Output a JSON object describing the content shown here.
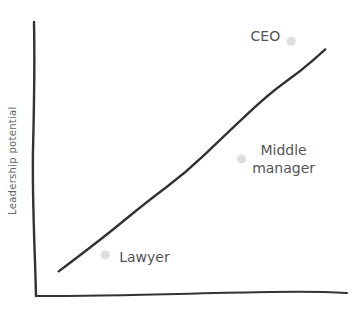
{
  "chart_data": {
    "type": "scatter",
    "title": "",
    "xlabel": "",
    "ylabel": "Leadership potential",
    "xlim": [
      0,
      100
    ],
    "ylim": [
      0,
      100
    ],
    "grid": false,
    "legend": "none",
    "trend_line": {
      "description": "hand-drawn rising diagonal line",
      "points": [
        [
          7,
          9
        ],
        [
          20,
          20
        ],
        [
          35,
          34
        ],
        [
          48,
          45
        ],
        [
          60,
          58
        ],
        [
          75,
          74
        ],
        [
          85,
          82
        ],
        [
          93,
          90
        ]
      ],
      "color": "#333333"
    },
    "points": [
      {
        "label": "CEO",
        "x": 82,
        "y": 93,
        "label_position": "left"
      },
      {
        "label": "Middle manager",
        "label_lines": [
          "Middle",
          "manager"
        ],
        "x": 66,
        "y": 50,
        "label_position": "right"
      },
      {
        "label": "Lawyer",
        "x": 22,
        "y": 15,
        "label_position": "right"
      }
    ],
    "point_color": "#dddddd",
    "axis_color": "#333333",
    "label_color": "#555555"
  }
}
